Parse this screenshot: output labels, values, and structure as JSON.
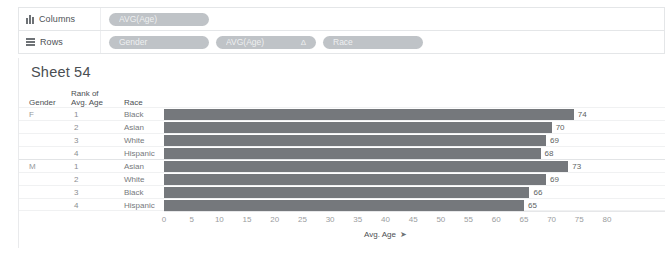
{
  "shelves": {
    "columns": {
      "label": "Columns",
      "icon": "columns-icon",
      "pills": [
        {
          "text": "AVG(Age)"
        }
      ]
    },
    "rows": {
      "label": "Rows",
      "icon": "rows-icon",
      "pills": [
        {
          "text": "Gender"
        },
        {
          "text": "AVG(Age)",
          "badge": "Δ"
        },
        {
          "text": "Race"
        }
      ]
    }
  },
  "view": {
    "sheet_title": "Sheet 54",
    "headers": {
      "gender": "Gender",
      "rank_line1": "Rank of",
      "rank_line2": "Avg. Age",
      "race": "Race"
    },
    "rows": [
      {
        "gender": "F",
        "rank": "1",
        "race": "Black",
        "value": 74,
        "label": "74"
      },
      {
        "gender": "",
        "rank": "2",
        "race": "Asian",
        "value": 70,
        "label": "70"
      },
      {
        "gender": "",
        "rank": "3",
        "race": "White",
        "value": 69,
        "label": "69"
      },
      {
        "gender": "",
        "rank": "4",
        "race": "Hispanic",
        "value": 68,
        "label": "68"
      },
      {
        "gender": "M",
        "rank": "1",
        "race": "Asian",
        "value": 73,
        "label": "73"
      },
      {
        "gender": "",
        "rank": "2",
        "race": "White",
        "value": 69,
        "label": "69"
      },
      {
        "gender": "",
        "rank": "3",
        "race": "Black",
        "value": 66,
        "label": "66"
      },
      {
        "gender": "",
        "rank": "4",
        "race": "Hispanic",
        "value": 65,
        "label": "65"
      }
    ],
    "axis": {
      "title": "Avg. Age",
      "pin_icon": "➤",
      "ticks": [
        "0",
        "5",
        "10",
        "15",
        "20",
        "25",
        "30",
        "35",
        "40",
        "45",
        "50",
        "55",
        "60",
        "65",
        "70",
        "75",
        "80"
      ]
    }
  },
  "colors": {
    "bar": "#75787c",
    "pill": "#bfc3c7",
    "text": "#55575a",
    "grid": "#f0f1f2"
  },
  "chart_data": {
    "type": "bar",
    "title": "Sheet 54",
    "orientation": "horizontal",
    "categories": [
      "F / 1 / Black",
      "F / 2 / Asian",
      "F / 3 / White",
      "F / 4 / Hispanic",
      "M / 1 / Asian",
      "M / 2 / White",
      "M / 3 / Black",
      "M / 4 / Hispanic"
    ],
    "values": [
      74,
      70,
      69,
      68,
      73,
      69,
      66,
      65
    ],
    "xlabel": "Avg. Age",
    "ylabel": "",
    "xlim": [
      0,
      80
    ],
    "xticks": [
      0,
      5,
      10,
      15,
      20,
      25,
      30,
      35,
      40,
      45,
      50,
      55,
      60,
      65,
      70,
      75,
      80
    ],
    "grid": true,
    "legend": "none",
    "dimensions": [
      "Gender",
      "Rank of Avg. Age",
      "Race"
    ],
    "measure": "AVG(Age)"
  }
}
